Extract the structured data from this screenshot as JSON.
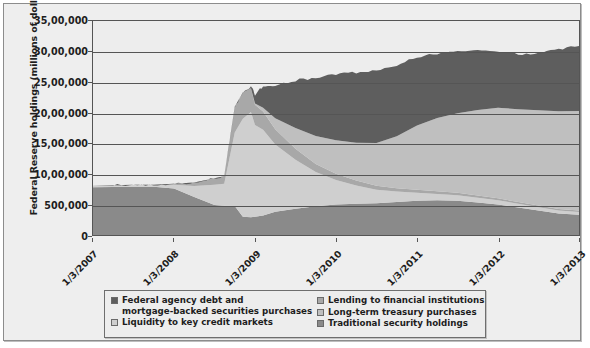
{
  "chart_data": {
    "type": "area",
    "stacked": true,
    "title": "",
    "xlabel": "",
    "ylabel": "Federal Reserve holdings (millions of dollars)",
    "ylim": [
      0,
      3500000
    ],
    "ytick_values": [
      0,
      500000,
      1000000,
      1500000,
      2000000,
      2500000,
      3000000,
      3500000
    ],
    "ytick_labels": [
      "0",
      "500,000",
      "10,00,000",
      "15,00,000",
      "20,00,000",
      "25,00,000",
      "30,00,000",
      "35,00,000"
    ],
    "grid": true,
    "grid_axis": "y",
    "legend_position": "bottom",
    "xtick_labels": [
      "1/3/2007",
      "1/3/2008",
      "1/3/2009",
      "1/3/2010",
      "1/3/2011",
      "1/3/2012",
      "1/3/2013"
    ],
    "x": [
      2007.0,
      2007.25,
      2007.5,
      2007.75,
      2008.0,
      2008.25,
      2008.5,
      2008.62,
      2008.75,
      2008.85,
      2008.95,
      2009.0,
      2009.1,
      2009.25,
      2009.5,
      2009.75,
      2010.0,
      2010.25,
      2010.5,
      2010.75,
      2011.0,
      2011.25,
      2011.5,
      2011.75,
      2012.0,
      2012.25,
      2012.5,
      2012.75,
      2013.0
    ],
    "series": [
      {
        "name": "Traditional security holdings",
        "color": "#8a8a8a",
        "values": [
          780000,
          785000,
          790000,
          790000,
          760000,
          620000,
          490000,
          480000,
          476000,
          300000,
          290000,
          300000,
          320000,
          380000,
          430000,
          470000,
          500000,
          510000,
          520000,
          540000,
          560000,
          570000,
          560000,
          530000,
          500000,
          450000,
          400000,
          350000,
          330000
        ]
      },
      {
        "name": "Liquidity to key credit markets",
        "color": "#cfcfcf",
        "values": [
          30000,
          30000,
          30000,
          30000,
          60000,
          180000,
          330000,
          360000,
          1200000,
          1600000,
          1720000,
          1500000,
          1400000,
          1100000,
          800000,
          560000,
          400000,
          300000,
          220000,
          170000,
          130000,
          100000,
          90000,
          80000,
          70000,
          60000,
          55000,
          50000,
          45000
        ]
      },
      {
        "name": "Lending to financial institutions",
        "color": "#a8a8a8",
        "values": [
          0,
          0,
          0,
          0,
          20000,
          60000,
          110000,
          120000,
          420000,
          430000,
          390000,
          330000,
          300000,
          250000,
          180000,
          130000,
          100000,
          80000,
          65000,
          55000,
          50000,
          45000,
          40000,
          35000,
          30000,
          28000,
          26000,
          25000,
          25000
        ]
      },
      {
        "name": "Long-term treasury purchases",
        "color": "#bfbfbf",
        "values": [
          0,
          0,
          0,
          0,
          0,
          0,
          0,
          0,
          0,
          0,
          0,
          20000,
          60000,
          180000,
          340000,
          460000,
          550000,
          620000,
          700000,
          850000,
          1050000,
          1200000,
          1300000,
          1400000,
          1480000,
          1520000,
          1560000,
          1600000,
          1630000
        ]
      },
      {
        "name": "Federal agency debt and mortgage-backed securities purchases",
        "color": "#5e5e5e",
        "values": [
          0,
          0,
          0,
          0,
          0,
          0,
          0,
          0,
          0,
          0,
          30000,
          150000,
          350000,
          550000,
          780000,
          950000,
          1080000,
          1150000,
          1180000,
          1160000,
          1120000,
          1060000,
          1000000,
          960000,
          920000,
          900000,
          930000,
          1010000,
          1060000
        ]
      }
    ]
  },
  "axes": {
    "y_title": "Federal Reserve holdings (millions of dollars)"
  },
  "legend": {
    "left_column": [
      {
        "line1": "Federal agency debt and",
        "line2": "mortgage-backed securities purchases",
        "swatch_color": "#5e5e5e",
        "name": "federal-agency-debt-mbs"
      },
      {
        "line1": "Liquidity to key credit markets",
        "line2": "",
        "swatch_color": "#cfcfcf",
        "name": "liquidity-key-credit-markets"
      }
    ],
    "right_column": [
      {
        "line1": "Lending to financial institutions",
        "line2": "",
        "swatch_color": "#a8a8a8",
        "name": "lending-financial-institutions"
      },
      {
        "line1": "Long-term treasury purchases",
        "line2": "",
        "swatch_color": "#bfbfbf",
        "name": "long-term-treasury-purchases"
      },
      {
        "line1": "Traditional security holdings",
        "line2": "",
        "swatch_color": "#8a8a8a",
        "name": "traditional-security-holdings"
      }
    ]
  }
}
